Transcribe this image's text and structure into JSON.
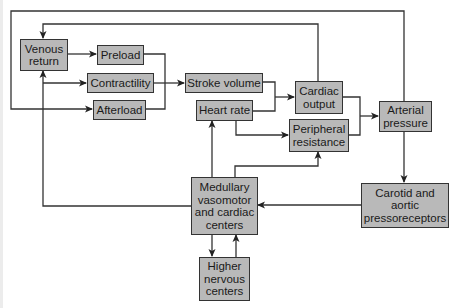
{
  "diagram": {
    "type": "flowchart",
    "box_fill": "#b9b9b9",
    "line_color": "#333333",
    "nodes": {
      "venous_return": "Venous\nreturn",
      "preload": "Preload",
      "contractility": "Contractility",
      "afterload": "Afterload",
      "stroke_volume": "Stroke volume",
      "heart_rate": "Heart rate",
      "cardiac_output": "Cardiac\noutput",
      "peripheral_resistance": "Peripheral\nresistance",
      "arterial_pressure": "Arterial\npressure",
      "pressoreceptors": "Carotid and\naortic\npressoreceptors",
      "medullary_centers": "Medullary\nvasomotor\nand cardiac\ncenters",
      "higher_centers": "Higher\nnervous\ncenters"
    },
    "edges": [
      {
        "from": "Venous return",
        "to": "Preload"
      },
      {
        "from": "Preload",
        "to": "Stroke volume"
      },
      {
        "from": "Contractility",
        "to": "Stroke volume"
      },
      {
        "from": "Afterload",
        "to": "Stroke volume"
      },
      {
        "from": "Stroke volume",
        "to": "Cardiac output"
      },
      {
        "from": "Heart rate",
        "to": "Cardiac output"
      },
      {
        "from": "Heart rate",
        "to": "Peripheral resistance"
      },
      {
        "from": "Cardiac output",
        "to": "Arterial pressure"
      },
      {
        "from": "Peripheral resistance",
        "to": "Arterial pressure"
      },
      {
        "from": "Cardiac output",
        "to": "Venous return"
      },
      {
        "from": "Arterial pressure",
        "to": "Afterload"
      },
      {
        "from": "Arterial pressure",
        "to": "Carotid and aortic pressoreceptors"
      },
      {
        "from": "Carotid and aortic pressoreceptors",
        "to": "Medullary vasomotor and cardiac centers"
      },
      {
        "from": "Medullary vasomotor and cardiac centers",
        "to": "Heart rate"
      },
      {
        "from": "Medullary vasomotor and cardiac centers",
        "to": "Peripheral resistance"
      },
      {
        "from": "Medullary vasomotor and cardiac centers",
        "to": "Venous return"
      },
      {
        "from": "Medullary vasomotor and cardiac centers",
        "to": "Contractility"
      },
      {
        "from": "Medullary vasomotor and cardiac centers",
        "to": "Higher nervous centers"
      },
      {
        "from": "Higher nervous centers",
        "to": "Medullary vasomotor and cardiac centers"
      }
    ]
  }
}
